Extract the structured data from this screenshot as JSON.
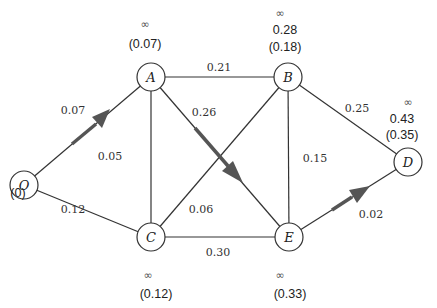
{
  "diagram": {
    "type": "weighted-graph-shortest-path",
    "nodes": [
      {
        "id": "O",
        "label": "O",
        "x": 24,
        "y": 185,
        "annotations": {
          "inf": "",
          "value": "",
          "final": "(0)"
        }
      },
      {
        "id": "A",
        "label": "A",
        "x": 151,
        "y": 77,
        "annotations": {
          "inf": "∞",
          "value": "",
          "final": "(0.07)"
        }
      },
      {
        "id": "B",
        "label": "B",
        "x": 288,
        "y": 77,
        "annotations": {
          "inf": "∞",
          "value": "0.28",
          "final": "(0.18)"
        }
      },
      {
        "id": "C",
        "label": "C",
        "x": 151,
        "y": 237,
        "annotations": {
          "inf": "∞",
          "value": "",
          "final": "(0.12)"
        }
      },
      {
        "id": "E",
        "label": "E",
        "x": 289,
        "y": 237,
        "annotations": {
          "inf": "∞",
          "value": "",
          "final": "(0.33)"
        }
      },
      {
        "id": "D",
        "label": "D",
        "x": 408,
        "y": 162,
        "annotations": {
          "inf": "∞",
          "value": "0.43",
          "final": "(0.35)"
        }
      }
    ],
    "edges": [
      {
        "from": "O",
        "to": "A",
        "weight": "0.07",
        "highlighted": true
      },
      {
        "from": "O",
        "to": "C",
        "weight": "0.12",
        "highlighted": false
      },
      {
        "from": "A",
        "to": "B",
        "weight": "0.21",
        "highlighted": false
      },
      {
        "from": "A",
        "to": "C",
        "weight": "0.05",
        "highlighted": false
      },
      {
        "from": "A",
        "to": "E",
        "weight": "0.26",
        "highlighted": true
      },
      {
        "from": "B",
        "to": "C",
        "weight": "0.06",
        "highlighted": false
      },
      {
        "from": "B",
        "to": "E",
        "weight": "0.15",
        "highlighted": false
      },
      {
        "from": "B",
        "to": "D",
        "weight": "0.25",
        "highlighted": false
      },
      {
        "from": "C",
        "to": "E",
        "weight": "0.30",
        "highlighted": false
      },
      {
        "from": "E",
        "to": "D",
        "weight": "0.02",
        "highlighted": true
      }
    ]
  },
  "labels": {
    "nodes": {
      "O": "O",
      "A": "A",
      "B": "B",
      "C": "C",
      "E": "E",
      "D": "D"
    },
    "edges": {
      "OA": "0.07",
      "OC": "0.12",
      "AB": "0.21",
      "AC": "0.05",
      "AE": "0.26",
      "BC": "0.06",
      "BE": "0.15",
      "BD": "0.25",
      "CE": "0.30",
      "ED": "0.02"
    },
    "annotations": {
      "O_final": "(0)",
      "A_inf": "∞",
      "A_final": "(0.07)",
      "B_inf": "∞",
      "B_value": "0.28",
      "B_final": "(0.18)",
      "D_inf": "∞",
      "D_value": "0.43",
      "D_final": "(0.35)",
      "C_inf": "∞",
      "C_final": "(0.12)",
      "E_inf": "∞",
      "E_final": "(0.33)"
    }
  },
  "colors": {
    "edge": "#333333",
    "highlight_arrow": "#555555",
    "node_stroke": "#333333",
    "node_fill": "#ffffff"
  }
}
